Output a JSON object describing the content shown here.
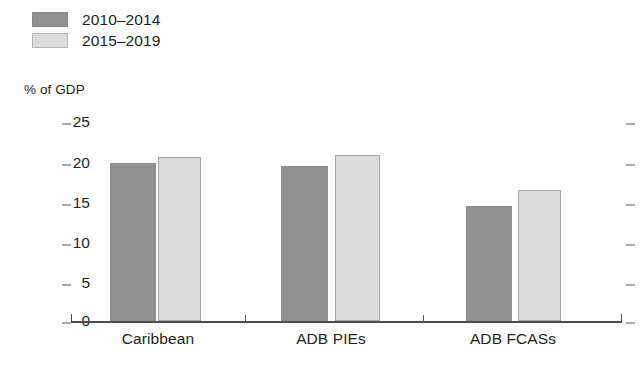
{
  "chart_data": {
    "type": "bar",
    "title": "",
    "subtitle": "",
    "xlabel": "",
    "ylabel": "% of GDP",
    "ylim": [
      0,
      25
    ],
    "yticks": [
      0,
      5,
      10,
      15,
      20,
      25
    ],
    "ytick_labels": [
      "0",
      "5",
      "10",
      "15",
      "20",
      "25"
    ],
    "grid": false,
    "legend_position": "top-left",
    "categories": [
      "Caribbean",
      "ADB PIEs",
      "ADB FCASs"
    ],
    "series": [
      {
        "name": "2010–2014",
        "color": "#919191",
        "values": [
          19.9,
          19.5,
          14.4
        ]
      },
      {
        "name": "2015–2019",
        "color": "#dcdcdc",
        "values": [
          20.6,
          20.8,
          16.5
        ]
      }
    ]
  },
  "legend": {
    "items": [
      {
        "label": "2010–2014",
        "swatch": "dark"
      },
      {
        "label": "2015–2019",
        "swatch": "light"
      }
    ]
  },
  "axis": {
    "unit_label": "% of GDP",
    "tick_labels": [
      "25",
      "20",
      "15",
      "10",
      "5",
      "0"
    ],
    "category_labels": [
      "Caribbean",
      "ADB PIEs",
      "ADB FCASs"
    ]
  },
  "colors": {
    "series_dark": "#919191",
    "series_light": "#dcdcdc",
    "axis": "#4d4d4d",
    "text": "#231f20",
    "background": "#ffffff"
  }
}
